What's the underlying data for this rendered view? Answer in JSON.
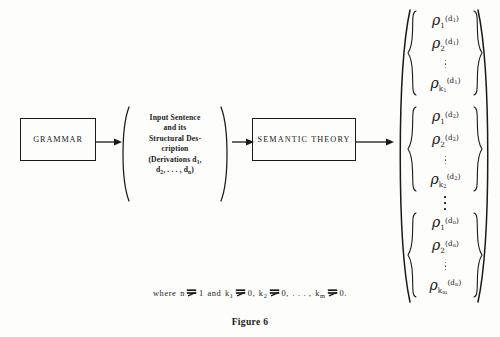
{
  "figure": {
    "caption": "Figure 6",
    "background_color": "#fdfdfc",
    "ink_color": "#1a1a1a"
  },
  "nodes": {
    "grammar": {
      "label": "GRAMMAR"
    },
    "semantic_theory": {
      "label": "SEMANTIC THEORY"
    },
    "input_sentence": {
      "lines": [
        "Input Sentence",
        "and its",
        "Structural Des-",
        "cription"
      ],
      "derivations_prefix": "(Derivations d",
      "derivations_sub_1": "1",
      "derivations_mid": ",",
      "derivations_line2_prefix": "d",
      "derivations_line2_sub": "2",
      "derivations_line2_dots": ", . . . , d",
      "derivations_line2_sub_n": "n",
      "derivations_suffix": ")"
    }
  },
  "arrows": [
    {
      "name": "grammar-to-input"
    },
    {
      "name": "input-to-semantic"
    },
    {
      "name": "semantic-to-output"
    }
  ],
  "output": {
    "symbol": "ρ",
    "groups": [
      {
        "superscript": "(d",
        "superscript_sub": "1",
        "superscript_close": ")",
        "items": [
          {
            "subscript": "1"
          },
          {
            "subscript": "2"
          },
          {
            "subscript": "k",
            "subscript_sub": "1"
          }
        ]
      },
      {
        "superscript": "(d",
        "superscript_sub": "2",
        "superscript_close": ")",
        "items": [
          {
            "subscript": "1"
          },
          {
            "subscript": "2"
          },
          {
            "subscript": "k",
            "subscript_sub": "2"
          }
        ]
      },
      {
        "superscript": "(d",
        "superscript_sub": "n",
        "superscript_close": ")",
        "items": [
          {
            "subscript": "1"
          },
          {
            "subscript": "2"
          },
          {
            "subscript": "k",
            "subscript_sub": "m"
          }
        ]
      }
    ]
  },
  "where_clause": {
    "where": "where",
    "n": "n",
    "one": "1",
    "and": "and",
    "k1": "k",
    "k1_sub": "1",
    "zero1": "0,",
    "k2": "k",
    "k2_sub": "2",
    "zero2": "0,",
    "dots": ". . . ,",
    "km": "k",
    "km_sub": "m",
    "zero3": "0."
  }
}
